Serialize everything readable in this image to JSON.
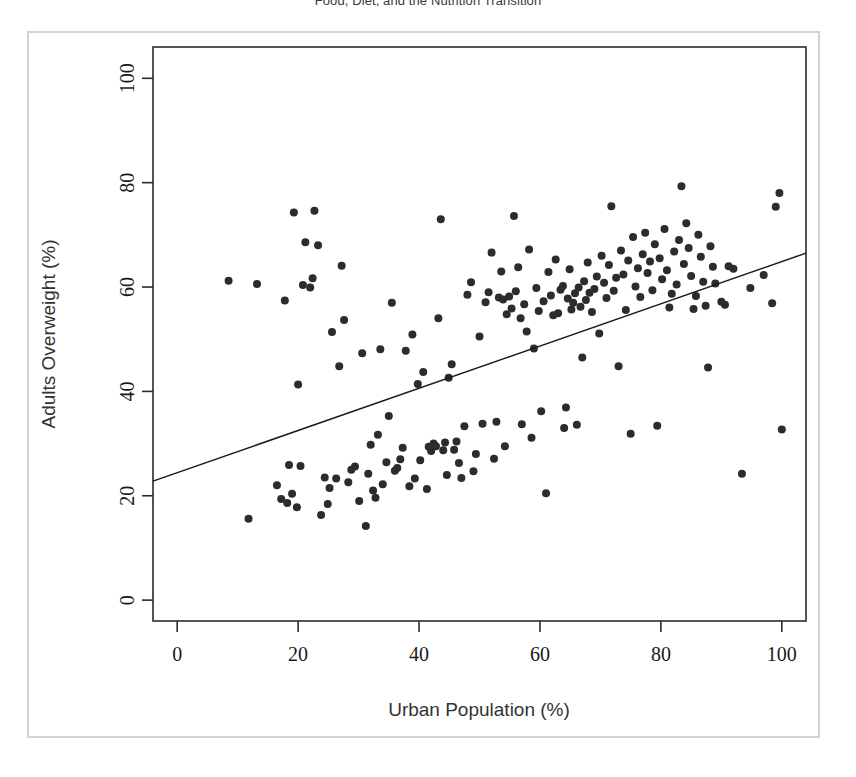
{
  "page": {
    "title": "Food, Diet, and the Nutrition Transition",
    "background": "#ffffff",
    "frame_color": "#d2d2d2"
  },
  "chart_data": {
    "type": "scatter",
    "title": "",
    "xlabel": "Urban Population (%)",
    "ylabel": "Adults Overweight (%)",
    "xlim": [
      -4,
      104
    ],
    "ylim": [
      -4,
      106
    ],
    "xticks": [
      0,
      20,
      40,
      60,
      80,
      100
    ],
    "yticks": [
      0,
      20,
      40,
      60,
      80,
      100
    ],
    "grid": false,
    "legend": null,
    "point_color": "#2c2c2c",
    "point_size": 8,
    "trendline": {
      "type": "linear",
      "color": "#1a1a1a",
      "x_start": -4,
      "y_start": 22.8,
      "x_end": 104,
      "y_end": 66.5
    },
    "points": [
      [
        8.5,
        61.2
      ],
      [
        11.8,
        15.6
      ],
      [
        13.2,
        60.6
      ],
      [
        16.5,
        22.0
      ],
      [
        17.2,
        19.4
      ],
      [
        17.8,
        57.4
      ],
      [
        18.2,
        18.6
      ],
      [
        18.5,
        25.9
      ],
      [
        19.0,
        20.4
      ],
      [
        19.3,
        74.3
      ],
      [
        19.8,
        17.8
      ],
      [
        20.0,
        41.3
      ],
      [
        20.4,
        25.7
      ],
      [
        20.8,
        60.4
      ],
      [
        21.2,
        68.6
      ],
      [
        22.0,
        59.9
      ],
      [
        22.4,
        61.7
      ],
      [
        22.7,
        74.6
      ],
      [
        23.3,
        68.0
      ],
      [
        23.8,
        16.3
      ],
      [
        24.4,
        23.5
      ],
      [
        24.9,
        18.4
      ],
      [
        25.2,
        21.5
      ],
      [
        25.6,
        51.4
      ],
      [
        26.3,
        23.3
      ],
      [
        26.8,
        44.8
      ],
      [
        27.2,
        64.1
      ],
      [
        27.6,
        53.7
      ],
      [
        28.3,
        22.6
      ],
      [
        28.8,
        25.0
      ],
      [
        29.4,
        25.6
      ],
      [
        30.1,
        19.0
      ],
      [
        30.6,
        47.3
      ],
      [
        31.2,
        14.2
      ],
      [
        31.6,
        24.2
      ],
      [
        32.0,
        29.8
      ],
      [
        32.4,
        21.0
      ],
      [
        32.8,
        19.6
      ],
      [
        33.2,
        31.7
      ],
      [
        33.6,
        48.1
      ],
      [
        34.0,
        22.2
      ],
      [
        34.6,
        26.4
      ],
      [
        35.0,
        35.3
      ],
      [
        35.5,
        57.0
      ],
      [
        36.0,
        24.8
      ],
      [
        36.4,
        25.3
      ],
      [
        36.9,
        27.0
      ],
      [
        37.3,
        29.2
      ],
      [
        37.8,
        47.8
      ],
      [
        38.4,
        21.8
      ],
      [
        38.9,
        50.9
      ],
      [
        39.3,
        23.3
      ],
      [
        39.8,
        41.4
      ],
      [
        40.2,
        26.8
      ],
      [
        40.7,
        43.7
      ],
      [
        41.3,
        21.3
      ],
      [
        41.6,
        29.4
      ],
      [
        42.0,
        28.6
      ],
      [
        42.4,
        30.0
      ],
      [
        42.8,
        29.5
      ],
      [
        43.2,
        54.0
      ],
      [
        43.6,
        73.0
      ],
      [
        44.0,
        28.7
      ],
      [
        44.3,
        30.2
      ],
      [
        44.6,
        24.0
      ],
      [
        44.9,
        42.6
      ],
      [
        45.4,
        45.2
      ],
      [
        45.8,
        28.8
      ],
      [
        46.2,
        30.4
      ],
      [
        46.6,
        26.3
      ],
      [
        47.0,
        23.4
      ],
      [
        47.5,
        33.3
      ],
      [
        48.0,
        58.5
      ],
      [
        48.6,
        60.9
      ],
      [
        49.0,
        24.7
      ],
      [
        49.4,
        28.0
      ],
      [
        50.0,
        50.5
      ],
      [
        50.5,
        33.8
      ],
      [
        51.0,
        57.1
      ],
      [
        51.5,
        59.0
      ],
      [
        52.0,
        66.6
      ],
      [
        52.4,
        27.1
      ],
      [
        52.8,
        34.2
      ],
      [
        53.2,
        58.0
      ],
      [
        53.6,
        63.0
      ],
      [
        53.9,
        57.6
      ],
      [
        54.2,
        29.5
      ],
      [
        54.5,
        54.8
      ],
      [
        54.9,
        58.2
      ],
      [
        55.3,
        55.9
      ],
      [
        55.7,
        73.6
      ],
      [
        56.0,
        59.2
      ],
      [
        56.4,
        63.8
      ],
      [
        56.8,
        54.0
      ],
      [
        57.0,
        33.7
      ],
      [
        57.4,
        56.7
      ],
      [
        57.8,
        51.5
      ],
      [
        58.2,
        67.2
      ],
      [
        58.6,
        31.1
      ],
      [
        59.0,
        48.2
      ],
      [
        59.4,
        59.8
      ],
      [
        59.8,
        55.4
      ],
      [
        60.2,
        36.2
      ],
      [
        60.6,
        57.3
      ],
      [
        61.0,
        20.5
      ],
      [
        61.4,
        62.9
      ],
      [
        61.8,
        58.4
      ],
      [
        62.2,
        54.6
      ],
      [
        62.6,
        65.3
      ],
      [
        63.0,
        55.0
      ],
      [
        63.4,
        59.5
      ],
      [
        63.8,
        60.2
      ],
      [
        64.0,
        33.0
      ],
      [
        64.3,
        36.9
      ],
      [
        64.6,
        57.8
      ],
      [
        64.9,
        63.4
      ],
      [
        65.2,
        55.7
      ],
      [
        65.5,
        57.0
      ],
      [
        65.8,
        58.8
      ],
      [
        66.1,
        33.6
      ],
      [
        66.4,
        59.9
      ],
      [
        66.7,
        56.2
      ],
      [
        67.0,
        46.5
      ],
      [
        67.3,
        61.1
      ],
      [
        67.6,
        57.5
      ],
      [
        67.9,
        64.7
      ],
      [
        68.2,
        58.9
      ],
      [
        68.6,
        55.2
      ],
      [
        69.0,
        59.6
      ],
      [
        69.4,
        62.0
      ],
      [
        69.8,
        51.1
      ],
      [
        70.2,
        66.0
      ],
      [
        70.6,
        60.8
      ],
      [
        71.0,
        57.9
      ],
      [
        71.4,
        64.2
      ],
      [
        71.8,
        75.5
      ],
      [
        72.2,
        59.3
      ],
      [
        72.6,
        61.8
      ],
      [
        73.0,
        44.8
      ],
      [
        73.4,
        67.0
      ],
      [
        73.8,
        62.4
      ],
      [
        74.2,
        55.6
      ],
      [
        74.6,
        65.1
      ],
      [
        75.0,
        31.9
      ],
      [
        75.4,
        69.6
      ],
      [
        75.8,
        60.1
      ],
      [
        76.2,
        63.6
      ],
      [
        76.6,
        58.1
      ],
      [
        77.0,
        66.3
      ],
      [
        77.4,
        70.4
      ],
      [
        77.8,
        62.7
      ],
      [
        78.2,
        64.9
      ],
      [
        78.6,
        59.4
      ],
      [
        79.0,
        68.2
      ],
      [
        79.4,
        33.4
      ],
      [
        79.8,
        65.5
      ],
      [
        80.2,
        61.5
      ],
      [
        80.6,
        71.1
      ],
      [
        81.0,
        63.2
      ],
      [
        81.4,
        56.1
      ],
      [
        81.8,
        58.7
      ],
      [
        82.2,
        66.8
      ],
      [
        82.6,
        60.5
      ],
      [
        83.0,
        69.0
      ],
      [
        83.4,
        79.3
      ],
      [
        83.8,
        64.4
      ],
      [
        84.2,
        72.2
      ],
      [
        84.6,
        67.5
      ],
      [
        85.0,
        62.1
      ],
      [
        85.4,
        55.8
      ],
      [
        85.8,
        58.3
      ],
      [
        86.2,
        70.0
      ],
      [
        86.6,
        65.8
      ],
      [
        87.0,
        61.0
      ],
      [
        87.4,
        56.4
      ],
      [
        87.8,
        44.6
      ],
      [
        88.2,
        67.8
      ],
      [
        88.6,
        63.9
      ],
      [
        89.0,
        60.7
      ],
      [
        90.0,
        57.2
      ],
      [
        90.6,
        56.6
      ],
      [
        91.2,
        64.0
      ],
      [
        92.0,
        63.5
      ],
      [
        93.4,
        24.2
      ],
      [
        94.8,
        59.8
      ],
      [
        97.0,
        62.3
      ],
      [
        98.4,
        56.9
      ],
      [
        99.0,
        75.4
      ],
      [
        99.6,
        78.0
      ],
      [
        100.0,
        32.7
      ]
    ]
  }
}
